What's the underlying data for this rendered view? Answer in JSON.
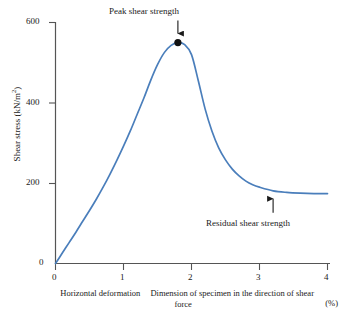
{
  "chart_data": {
    "type": "line",
    "title": "",
    "xlabel_numerator": "Horizontal deformation",
    "xlabel_denominator": "Dimension of specimen in the direction of shear force",
    "xlabel_unit": "(%)",
    "ylabel": "Shear stress (kN/m",
    "ylabel_sup": "2",
    "ylabel_close": ")",
    "xlim": [
      0,
      4
    ],
    "ylim": [
      0,
      620
    ],
    "xticks": [
      "0",
      "1",
      "2",
      "3",
      "4"
    ],
    "yticks": [
      "600",
      "400",
      "200",
      "0"
    ],
    "ytick_values": [
      600,
      400,
      200,
      0
    ],
    "xtick_values": [
      0,
      1,
      2,
      3,
      4
    ],
    "grid": false,
    "legend": "none",
    "series": [
      {
        "name": "Shear stress vs horizontal deformation",
        "color": "#4a7ebb",
        "x": [
          0.0,
          0.1,
          0.2,
          0.3,
          0.4,
          0.5,
          0.6,
          0.7,
          0.8,
          0.9,
          1.0,
          1.1,
          1.2,
          1.3,
          1.4,
          1.5,
          1.6,
          1.7,
          1.8,
          1.9,
          2.0,
          2.1,
          2.2,
          2.3,
          2.4,
          2.5,
          2.6,
          2.7,
          2.8,
          2.9,
          3.0,
          3.2,
          3.4,
          3.6,
          3.8,
          4.0
        ],
        "y": [
          0,
          26,
          52,
          78,
          105,
          132,
          160,
          190,
          222,
          256,
          292,
          330,
          371,
          412,
          456,
          495,
          525,
          543,
          550,
          545,
          520,
          455,
          385,
          330,
          288,
          258,
          235,
          218,
          205,
          196,
          190,
          181,
          177,
          175,
          174,
          174
        ]
      }
    ],
    "annotations": [
      {
        "id": "peak",
        "label": "Peak shear strength",
        "x": 1.8,
        "y": 550,
        "marker": "filled-circle",
        "arrow": "down"
      },
      {
        "id": "residual",
        "label": "Residual shear strength",
        "x": 3.2,
        "y": 181,
        "marker": "none",
        "arrow": "up"
      }
    ]
  },
  "axis": {
    "color": "#555555"
  }
}
